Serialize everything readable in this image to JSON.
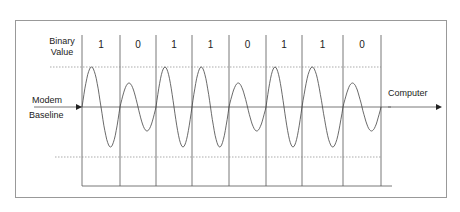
{
  "diagram": {
    "row_label": [
      "Binary",
      "Value"
    ],
    "bits": [
      "1",
      "0",
      "1",
      "1",
      "0",
      "1",
      "1",
      "0"
    ],
    "left_label": [
      "Modem",
      "Baseline"
    ],
    "right_label": "Computer",
    "colors": {
      "line": "#555555",
      "wave": "#444444",
      "dotted": "#888888",
      "frame": "#999999"
    }
  }
}
